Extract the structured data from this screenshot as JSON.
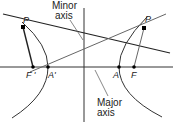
{
  "diagram": {
    "type": "hyperbola-construction",
    "labels": {
      "minor_axis_line1": "Minor",
      "minor_axis_line2": "axis",
      "major_axis_line1": "Major",
      "major_axis_line2": "axis",
      "point_p_left": "P",
      "point_p_right": "P",
      "focus_left": "F '",
      "vertex_left": "A'",
      "vertex_right": "A",
      "focus_right": "F"
    },
    "colors": {
      "line": "#222222",
      "light_line": "#666666",
      "text": "#222222"
    }
  }
}
